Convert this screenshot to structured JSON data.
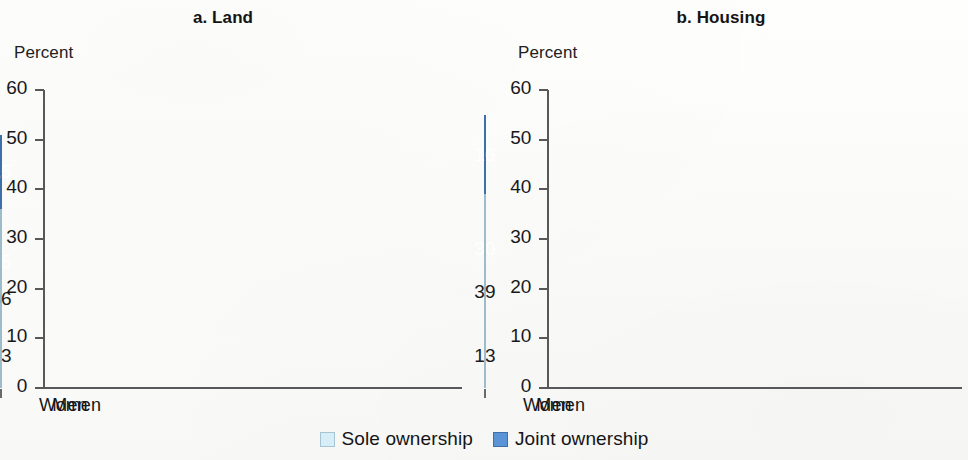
{
  "figure": {
    "y_caption_a": "Percent",
    "y_caption_b": "Percent"
  },
  "legend": {
    "items": [
      {
        "key": "sole",
        "label": "Sole ownership",
        "color": "#d7eef8",
        "swatch_icon": "legend-swatch-square"
      },
      {
        "key": "joint",
        "label": "Joint ownership",
        "color": "#5b94d6",
        "swatch_icon": "legend-swatch-square"
      }
    ]
  },
  "chart_data": [
    {
      "type": "bar",
      "id": "panel-a",
      "title": "a. Land",
      "xlabel": "",
      "ylabel": "Percent",
      "ylim": [
        0,
        60
      ],
      "yticks": [
        0,
        10,
        20,
        30,
        40,
        50,
        60
      ],
      "ytick_labels": [
        "0",
        "10",
        "20",
        "30",
        "40",
        "50",
        "60"
      ],
      "grid": false,
      "stacked": true,
      "legend_position": "bottom-center",
      "categories": [
        "Women",
        "Men"
      ],
      "series": [
        {
          "name": "Sole ownership",
          "color": "#d7eef8",
          "values": [
            13,
            36
          ]
        },
        {
          "name": "Joint ownership",
          "color": "#5b94d6",
          "values": [
            25,
            15
          ]
        }
      ],
      "totals": [
        38,
        51
      ]
    },
    {
      "type": "bar",
      "id": "panel-b",
      "title": "b. Housing",
      "xlabel": "",
      "ylabel": "Percent",
      "ylim": [
        0,
        60
      ],
      "yticks": [
        0,
        10,
        20,
        30,
        40,
        50,
        60
      ],
      "ytick_labels": [
        "0",
        "10",
        "20",
        "30",
        "40",
        "50",
        "60"
      ],
      "grid": false,
      "stacked": true,
      "legend_position": "bottom-center",
      "categories": [
        "Women",
        "Men"
      ],
      "series": [
        {
          "name": "Sole ownership",
          "color": "#d7eef8",
          "values": [
            13,
            39
          ]
        },
        {
          "name": "Joint ownership",
          "color": "#5b94d6",
          "values": [
            30,
            16
          ]
        }
      ],
      "totals": [
        43,
        55
      ]
    }
  ]
}
